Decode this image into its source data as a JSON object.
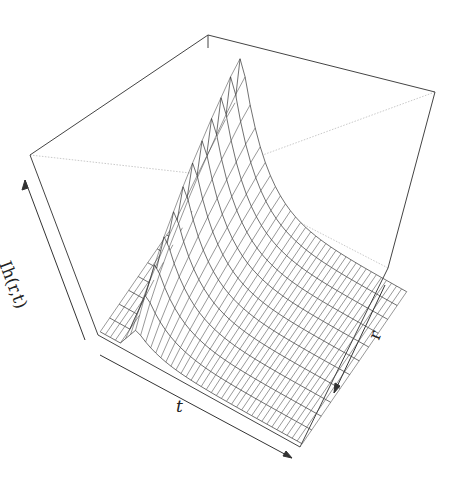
{
  "chart_data": {
    "type": "surface3d",
    "title": "",
    "axes": {
      "x": {
        "label": "t",
        "ticks": []
      },
      "y": {
        "label": "r",
        "ticks": []
      },
      "z": {
        "label": "Ih(r,t)",
        "ticks": []
      }
    },
    "grid": false,
    "box": true,
    "line_color": "#333333",
    "background": "#ffffff",
    "surface": {
      "t_steps": 12,
      "r_steps": 40,
      "peak_heights_by_t": [
        0.15,
        0.3,
        0.42,
        0.52,
        0.6,
        0.68,
        0.75,
        0.81,
        0.87,
        0.92,
        0.97,
        1.0
      ]
    }
  },
  "labels": {
    "z": "Ih(r,t)",
    "t": "t",
    "r": "r"
  }
}
